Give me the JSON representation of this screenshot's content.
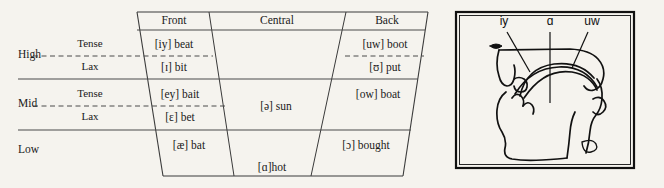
{
  "table": {
    "column_headers": [
      "Front",
      "Central",
      "Back"
    ],
    "row_labels": [
      "High",
      "Mid",
      "Low"
    ],
    "tenseness_labels": {
      "tense": "Tense",
      "lax": "Lax"
    },
    "rows": [
      {
        "label": "High",
        "subrows": [
          {
            "tenseness": "Tense",
            "cells": {
              "front": "[iy] beat",
              "central": "",
              "back": "[uw] boot"
            }
          },
          {
            "tenseness": "Lax",
            "cells": {
              "front": "[ɪ] bit",
              "central": "",
              "back": "[ʊ] put"
            }
          }
        ]
      },
      {
        "label": "Mid",
        "subrows": [
          {
            "tenseness": "Tense",
            "cells": {
              "front": "[ey] bait",
              "central": "[ə] sun",
              "back": "[ow] boat"
            }
          },
          {
            "tenseness": "Lax",
            "cells": {
              "front": "[ɛ] bet",
              "central": "",
              "back": ""
            }
          }
        ]
      },
      {
        "label": "Low",
        "subrows": [
          {
            "tenseness": "",
            "cells": {
              "front": "[æ] bat",
              "central": "[ɑ]hot",
              "back": "[ɔ] bought"
            }
          }
        ]
      }
    ],
    "entries": {
      "high_front_tense": "[iy] beat",
      "high_front_lax": "[ɪ] bit",
      "high_back_tense": "[uw] boot",
      "high_back_lax": "[ʊ] put",
      "mid_front_tense": "[ey] bait",
      "mid_front_lax": "[ɛ] bet",
      "mid_central": "[ə] sun",
      "mid_back": "[ow] boat",
      "low_front": "[æ] bat",
      "low_central": "[ɑ]hot",
      "low_back": "[ɔ] bought"
    }
  },
  "diagram": {
    "title": "",
    "labels": [
      "iy",
      "ɑ",
      "uw"
    ],
    "label_iy": "iy",
    "label_a": "ɑ",
    "label_uw": "uw"
  },
  "colors": {
    "background": "#f5f3ee",
    "ink": "#1a1a1a",
    "rule": "#555555",
    "diagram_ink": "#111111"
  }
}
